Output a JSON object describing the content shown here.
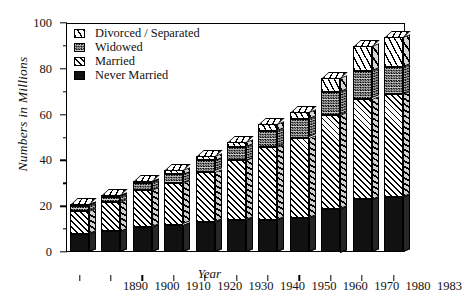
{
  "chart_data": {
    "type": "bar",
    "subtype": "stacked-3d-column",
    "title": "",
    "xlabel": "Year",
    "ylabel": "Numbers in Millions",
    "ylim": [
      0,
      100
    ],
    "ytick_values": [
      0,
      20,
      40,
      60,
      80,
      100
    ],
    "ytick_labels": [
      "0",
      "20",
      "40",
      "60",
      "80",
      "100"
    ],
    "yminor_values": [
      10,
      30,
      50,
      70,
      90
    ],
    "grid": false,
    "legend_position": "top-left",
    "categories": [
      "1890",
      "1900",
      "1910",
      "1920",
      "1930",
      "1940",
      "1950",
      "1960",
      "1970",
      "1980",
      "1983"
    ],
    "series": [
      {
        "name": "Never Married",
        "pattern": "solid-black",
        "values": [
          8,
          9,
          11,
          12,
          13,
          14,
          14,
          15,
          19,
          23,
          24
        ]
      },
      {
        "name": "Married",
        "pattern": "diagonal-hatch",
        "values": [
          10,
          13,
          16,
          18,
          22,
          26,
          32,
          35,
          41,
          44,
          45
        ]
      },
      {
        "name": "Widowed",
        "pattern": "checkered-gray",
        "values": [
          2,
          2,
          3,
          4,
          5,
          6,
          7,
          8,
          10,
          12,
          12
        ]
      },
      {
        "name": "Divorced / Separated",
        "pattern": "steep-hatch",
        "values": [
          1,
          1,
          1,
          2,
          2,
          2,
          3,
          3,
          6,
          11,
          13
        ]
      }
    ],
    "totals": [
      21,
      25,
      31,
      36,
      42,
      48,
      56,
      61,
      76,
      90,
      94
    ]
  },
  "legend": {
    "items": [
      {
        "label": "Divorced / Separated",
        "swatch": "steep-hatch-swatch"
      },
      {
        "label": "Widowed",
        "swatch": "checkered-gray-swatch"
      },
      {
        "label": "Married",
        "swatch": "diagonal-hatch-swatch"
      },
      {
        "label": "Never Married",
        "swatch": "solid-black-swatch"
      }
    ]
  }
}
